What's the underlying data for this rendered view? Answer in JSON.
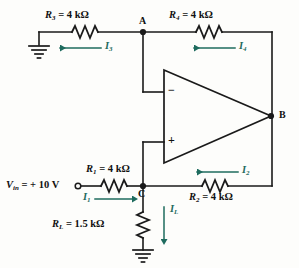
{
  "figure": {
    "type": "circuit-schematic",
    "background_color": "#fdfdfb",
    "wire_color": "#1a1a1a",
    "current_arrow_color": "#1e6b5e"
  },
  "components": {
    "r3": {
      "name": "R",
      "sub": "3",
      "eq": "=",
      "value": "4 kΩ",
      "full": "R3 = 4 kΩ"
    },
    "r4": {
      "name": "R",
      "sub": "4",
      "eq": "=",
      "value": "4 kΩ",
      "full": "R4 = 4 kΩ"
    },
    "r1": {
      "name": "R",
      "sub": "1",
      "eq": "=",
      "value": "4 kΩ",
      "full": "R1 = 4 kΩ"
    },
    "r2": {
      "name": "R",
      "sub": "2",
      "eq": "=",
      "value": "4 kΩ",
      "full": "R2 = 4 kΩ"
    },
    "rl": {
      "name": "R",
      "sub": "L",
      "eq": "=",
      "value": "1.5 kΩ",
      "full": "RL = 1.5 kΩ"
    }
  },
  "source": {
    "name": "V",
    "sub": "in",
    "eq": "=",
    "value": "+ 10 V",
    "full": "Vin = + 10 V"
  },
  "currents": {
    "i3": {
      "name": "I",
      "sub": "3",
      "direction": "left"
    },
    "i4": {
      "name": "I",
      "sub": "4",
      "direction": "left"
    },
    "i1": {
      "name": "I",
      "sub": "1",
      "direction": "right"
    },
    "i2": {
      "name": "I",
      "sub": "2",
      "direction": "left"
    },
    "il": {
      "name": "I",
      "sub": "L",
      "direction": "down"
    }
  },
  "nodes": {
    "a": "A",
    "b": "B",
    "c": "C"
  },
  "opamp": {
    "inverting_sign": "−",
    "noninverting_sign": "+",
    "inverting_input_node": "A",
    "noninverting_input_node": "C",
    "output_node": "B"
  },
  "grounds": [
    {
      "id": "ground-left",
      "label": ""
    },
    {
      "id": "ground-load",
      "label": ""
    }
  ]
}
